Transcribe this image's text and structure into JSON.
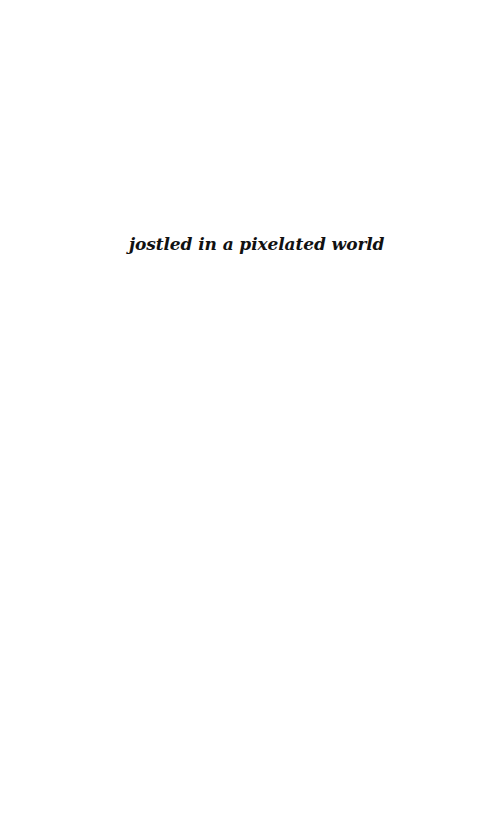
{
  "page": {
    "epigraph": "jostled in a pixelated world",
    "background_color": "#ffffff",
    "text_color": "#111111"
  }
}
